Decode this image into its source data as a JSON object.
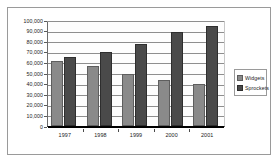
{
  "chart_data": {
    "type": "bar",
    "title": "",
    "xlabel": "",
    "ylabel": "",
    "categories": [
      "1997",
      "1998",
      "1999",
      "2000",
      "2001"
    ],
    "series": [
      {
        "name": "Widgets",
        "color": "#8a8a8a",
        "values": [
          61000,
          57000,
          49500,
          43000,
          40000
        ]
      },
      {
        "name": "Sprockets",
        "color": "#4a4a4a",
        "values": [
          65500,
          70000,
          77500,
          88500,
          94000
        ]
      }
    ],
    "ylim": [
      0,
      100000
    ],
    "ytick_step": 10000,
    "ytick_labels": [
      "100,000",
      "90,000",
      "80,000",
      "70,000",
      "60,000",
      "50,000",
      "40,000",
      "30,000",
      "20,000",
      "10,000",
      "0"
    ],
    "grid": true,
    "legend_position": "right"
  }
}
